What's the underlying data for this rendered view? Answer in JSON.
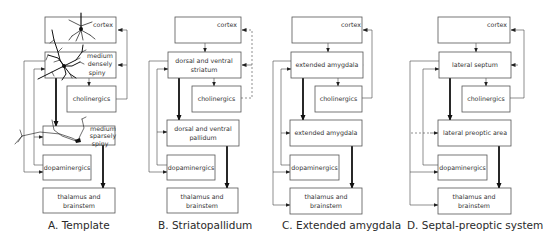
{
  "figure": {
    "panels": [
      {
        "id": "A",
        "caption": "A. Template",
        "boxes": {
          "cortex": "cortex",
          "upper_1": "medium",
          "upper_2": "densely",
          "upper_3": "spiny",
          "cholinergics": "cholinergics",
          "lower_1": "medium",
          "lower_2": "sparsely",
          "lower_3": "spiny",
          "dopaminergics": "dopaminergics",
          "thalamus_1": "thalamus and",
          "thalamus_2": "brainstem"
        },
        "icons": [
          "pyramidal-neuron-icon",
          "medium-densely-spiny-neuron-icon",
          "medium-sparsely-spiny-neuron-icon"
        ]
      },
      {
        "id": "B",
        "caption": "B. Striatopallidum",
        "boxes": {
          "cortex": "cortex",
          "upper_1": "dorsal and ventral",
          "upper_2": "striatum",
          "cholinergics": "cholinergics",
          "lower_1": "dorsal and ventral",
          "lower_2": "pallidum",
          "dopaminergics": "dopaminergics",
          "thalamus_1": "thalamus and",
          "thalamus_2": "brainstem"
        }
      },
      {
        "id": "C",
        "caption": "C. Extended amygdala",
        "boxes": {
          "cortex": "cortex",
          "upper_1": "extended amygdala",
          "cholinergics": "cholinergics",
          "lower_1": "extended amygdala",
          "dopaminergics": "dopaminergics",
          "thalamus_1": "thalamus and",
          "thalamus_2": "brainstem"
        }
      },
      {
        "id": "D",
        "caption": "D. Septal-preoptic system",
        "boxes": {
          "cortex": "cortex",
          "upper_1": "lateral septum",
          "cholinergics": "cholinergics",
          "lower_1": "lateral preoptic area",
          "dopaminergics": "dopaminergics",
          "thalamus_1": "thalamus and",
          "thalamus_2": "brainstem"
        }
      }
    ],
    "colors": {
      "box_stroke": "#555555",
      "line": "#444444",
      "thick_arrow": "#111111",
      "text": "#333333"
    }
  }
}
